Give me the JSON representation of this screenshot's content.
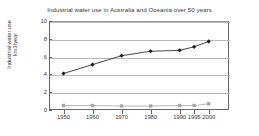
{
  "chart_data": {
    "type": "line",
    "title": "Industrial water use in Australia and Oceania over 50 years",
    "xlabel": "",
    "ylabel": "Industrial water use km3/year",
    "ylabel_line1": "Industrial water use",
    "ylabel_line2": "km3/year",
    "categories": [
      "1950",
      "1960",
      "1970",
      "1980",
      "1990",
      "1995",
      "2000"
    ],
    "x": [
      1950,
      1960,
      1970,
      1980,
      1990,
      1995,
      2000
    ],
    "xlim": [
      1945,
      2007
    ],
    "ylim": [
      0,
      10
    ],
    "yticks": [
      0,
      2,
      4,
      6,
      8,
      10
    ],
    "ytick_labels": [
      "0",
      "2",
      "4",
      "6",
      "8",
      "10"
    ],
    "grid": true,
    "legend": "none",
    "series": [
      {
        "name": "industrial-water-use",
        "color": "#1a1a1a",
        "marker": "diamond",
        "values": [
          4.1,
          5.1,
          6.1,
          6.6,
          6.7,
          7.1,
          7.7
        ]
      },
      {
        "name": "secondary-lower-series",
        "color": "#a6a6a6",
        "marker": "square",
        "values": [
          0.5,
          0.5,
          0.45,
          0.45,
          0.5,
          0.5,
          0.7
        ]
      }
    ]
  },
  "axes": {
    "y_tick_labels": [
      "10",
      "8",
      "6",
      "4",
      "2",
      "0"
    ],
    "x_tick_labels": [
      "1950",
      "1960",
      "1970",
      "1980",
      "1990",
      "1995",
      "2000"
    ]
  },
  "colors": {
    "primary_series": "#1a1a1a",
    "secondary_series": "#a6a6a6",
    "grid": "#b8b8b8",
    "axis": "#666666",
    "text": "#3a3a3a",
    "background": "#ffffff"
  }
}
